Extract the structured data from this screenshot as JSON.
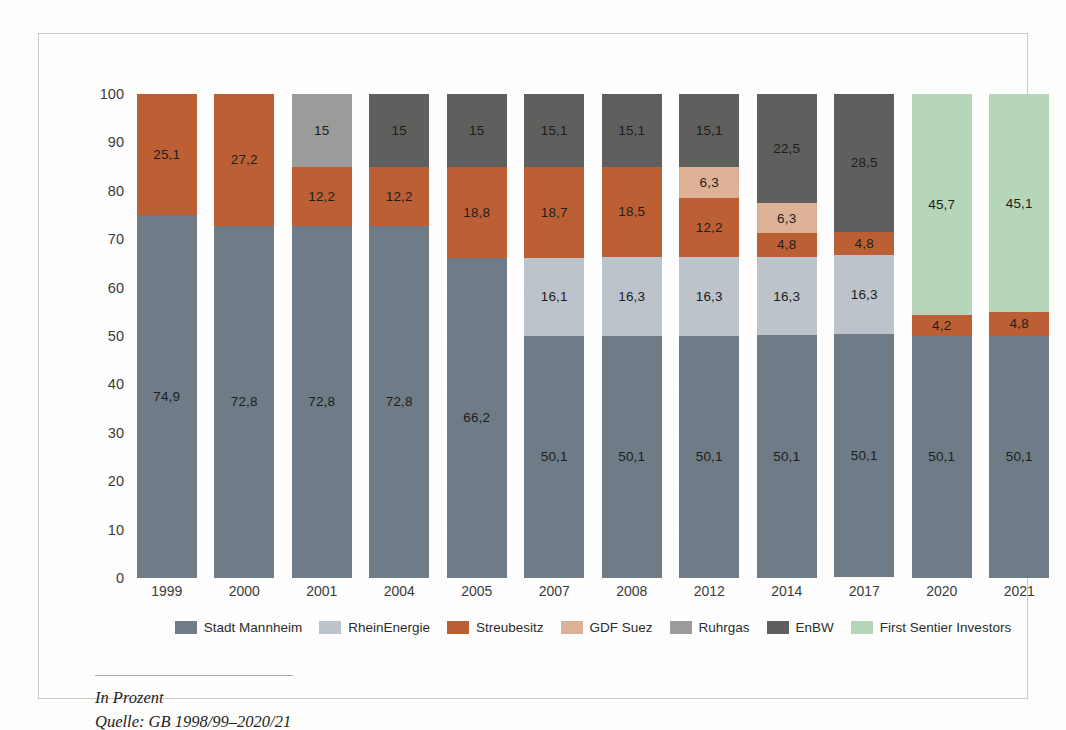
{
  "chart_data": {
    "type": "bar",
    "subtype": "stacked-100",
    "title": "",
    "xlabel": "",
    "ylabel": "",
    "ylim": [
      0,
      100
    ],
    "ytick_step": 10,
    "yticks": [
      "100",
      "90",
      "80",
      "70",
      "60",
      "50",
      "40",
      "30",
      "20",
      "10",
      "0"
    ],
    "grid": true,
    "legend_position": "bottom",
    "categories": [
      "1999",
      "2000",
      "2001",
      "2004",
      "2005",
      "2007",
      "2008",
      "2012",
      "2014",
      "2017",
      "2020",
      "2021"
    ],
    "series": [
      {
        "name": "Stadt Mannheim",
        "color": "#6f7b86",
        "values": [
          74.9,
          72.8,
          72.8,
          72.8,
          66.2,
          50.1,
          50.1,
          50.1,
          50.1,
          50.1,
          50.1,
          50.1
        ],
        "labels": [
          "74,9",
          "72,8",
          "72,8",
          "72,8",
          "66,2",
          "50,1",
          "50,1",
          "50,1",
          "50,1",
          "50,1",
          "50,1",
          "50,1"
        ]
      },
      {
        "name": "RheinEnergie",
        "color": "#bcc3ca",
        "values": [
          0,
          0,
          0,
          0,
          0,
          16.1,
          16.3,
          16.3,
          16.3,
          16.3,
          0,
          0
        ],
        "labels": [
          "",
          "",
          "",
          "",
          "",
          "16,1",
          "16,3",
          "16,3",
          "16,3",
          "16,3",
          "",
          ""
        ]
      },
      {
        "name": "Streubesitz",
        "color": "#bd5f35",
        "values": [
          25.1,
          27.2,
          12.2,
          12.2,
          18.8,
          18.7,
          18.5,
          12.2,
          4.8,
          4.8,
          4.2,
          4.8
        ],
        "labels": [
          "25,1",
          "27,2",
          "12,2",
          "12,2",
          "18,8",
          "18,7",
          "18,5",
          "12,2",
          "4,8",
          "4,8",
          "4,2",
          "4,8"
        ]
      },
      {
        "name": "GDF Suez",
        "color": "#ddb195",
        "values": [
          0,
          0,
          0,
          0,
          0,
          0,
          0,
          6.3,
          6.3,
          0,
          0,
          0
        ],
        "labels": [
          "",
          "",
          "",
          "",
          "",
          "",
          "",
          "6,3",
          "6,3",
          "",
          "",
          ""
        ]
      },
      {
        "name": "Ruhrgas",
        "color": "#9b9b99",
        "values": [
          0,
          0,
          15,
          0,
          0,
          0,
          0,
          0,
          0,
          0,
          0,
          0
        ],
        "labels": [
          "",
          "",
          "15",
          "",
          "",
          "",
          "",
          "",
          "",
          "",
          "",
          ""
        ]
      },
      {
        "name": "EnBW",
        "color": "#5f5f5e",
        "values": [
          0,
          0,
          0,
          15,
          15,
          15.1,
          15.1,
          15.1,
          22.5,
          28.5,
          0,
          0
        ],
        "labels": [
          "",
          "",
          "",
          "15",
          "15",
          "15,1",
          "15,1",
          "15,1",
          "22,5",
          "28,5",
          "",
          ""
        ]
      },
      {
        "name": "First Sentier Investors",
        "color": "#b5d6b8",
        "values": [
          0,
          0,
          0,
          0,
          0,
          0,
          0,
          0,
          0,
          0,
          45.7,
          45.1
        ],
        "labels": [
          "",
          "",
          "",
          "",
          "",
          "",
          "",
          "",
          "",
          "",
          "45,7",
          "45,1"
        ]
      }
    ],
    "stack_order": [
      "Stadt Mannheim",
      "RheinEnergie",
      "Streubesitz",
      "GDF Suez",
      "Ruhrgas",
      "EnBW",
      "First Sentier Investors"
    ],
    "notes": [
      "In Prozent",
      "Quelle: GB 1998/99–2020/21"
    ]
  },
  "legend": {
    "items": [
      {
        "label": "Stadt Mannheim",
        "color": "#6f7b86"
      },
      {
        "label": "RheinEnergie",
        "color": "#bcc3ca"
      },
      {
        "label": "Streubesitz",
        "color": "#bd5f35"
      },
      {
        "label": "GDF Suez",
        "color": "#ddb195"
      },
      {
        "label": "Ruhrgas",
        "color": "#9b9b99"
      },
      {
        "label": "EnBW",
        "color": "#5f5f5e"
      },
      {
        "label": "First Sentier Investors",
        "color": "#b5d6b8"
      }
    ]
  },
  "footer": {
    "line1": "In Prozent",
    "line2": "Quelle: GB 1998/99–2020/21"
  },
  "colors": {
    "plot_background": "#e2e8ea",
    "gridline": "#ffffff",
    "axis_text": "#3b3b39",
    "page_background": "#fdfdfc"
  }
}
